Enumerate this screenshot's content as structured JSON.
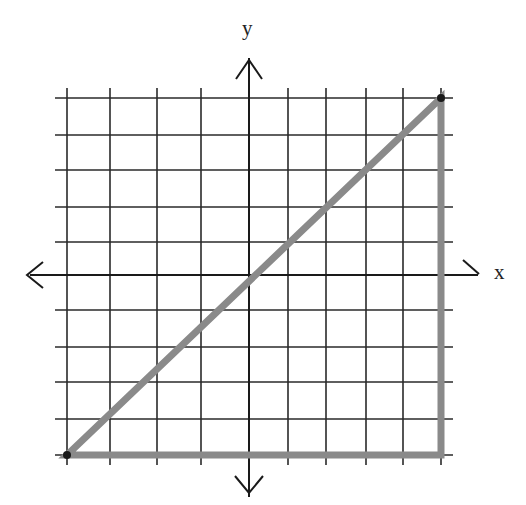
{
  "diagram": {
    "type": "coordinate-plane-triangle",
    "axes": {
      "x_label": "x",
      "y_label": "y"
    },
    "grid": {
      "x_range": [
        -5,
        5
      ],
      "y_range": [
        -5,
        5
      ],
      "step": 1,
      "x_pixels": [
        67,
        110,
        157,
        201,
        249,
        288,
        326,
        366,
        403,
        441
      ],
      "y_pixels": [
        98,
        135,
        170,
        207,
        242,
        275,
        310,
        347,
        382,
        419,
        455
      ],
      "origin_px": [
        249,
        275
      ],
      "grid_color": "#2a2a2a",
      "axis_color": "#1a1a1a"
    },
    "triangle": {
      "vertices": [
        [
          -5,
          -5
        ],
        [
          5,
          5
        ],
        [
          5,
          -5
        ]
      ],
      "vertices_px": [
        [
          67,
          455
        ],
        [
          441,
          98
        ],
        [
          441,
          455
        ]
      ],
      "stroke_color": "#8a8a8a",
      "stroke_width": 7
    }
  }
}
